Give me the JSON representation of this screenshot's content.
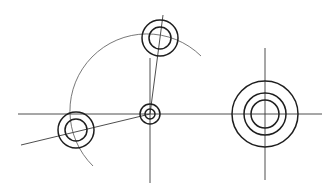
{
  "diagram": {
    "type": "technical-drawing",
    "colors": {
      "background": "#ffffff",
      "line": "#1e1e1e",
      "center_line": "#3a3a3a",
      "construction": "#555555"
    },
    "center_lines": [
      {
        "name": "horizontal-axis",
        "x1": 18,
        "y1": 114,
        "x2": 322,
        "y2": 114
      },
      {
        "name": "vertical-axis-center",
        "x1": 150,
        "y1": 58,
        "x2": 150,
        "y2": 183
      },
      {
        "name": "vertical-axis-right",
        "x1": 265,
        "y1": 48,
        "x2": 265,
        "y2": 180
      },
      {
        "name": "radial-line-top",
        "x1": 150,
        "y1": 114,
        "x2": 163,
        "y2": 15
      },
      {
        "name": "radial-line-left",
        "x1": 150,
        "y1": 114,
        "x2": 21,
        "y2": 145
      }
    ],
    "pitch_arc": {
      "cx": 150,
      "cy": 114,
      "r": 76,
      "path": "M 93 166 A 76 76 0 1 1 201 56"
    },
    "features": [
      {
        "name": "center-hole",
        "cx": 150,
        "cy": 114,
        "radii": [
          10,
          5
        ]
      },
      {
        "name": "top-hole",
        "cx": 160,
        "cy": 38,
        "radii": [
          18,
          11
        ]
      },
      {
        "name": "left-hole",
        "cx": 76,
        "cy": 130,
        "radii": [
          18,
          11
        ]
      },
      {
        "name": "right-boss",
        "cx": 265,
        "cy": 114,
        "radii": [
          33,
          21,
          14
        ]
      }
    ]
  }
}
